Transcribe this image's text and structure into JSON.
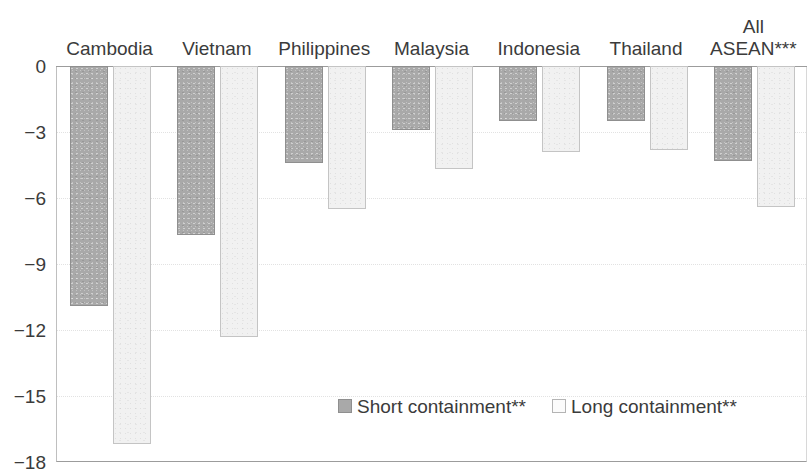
{
  "chart_data": {
    "type": "bar",
    "title": "",
    "subtitle": "",
    "xlabel": "",
    "ylabel": "",
    "ylim": [
      -18,
      0
    ],
    "ytick_step": 3,
    "ytick_labels": [
      "0",
      "−3",
      "−6",
      "−9",
      "−12",
      "−15",
      "−18"
    ],
    "ytick_values": [
      0,
      -3,
      -6,
      -9,
      -12,
      -15,
      -18
    ],
    "grid": true,
    "grid_axis": "y",
    "legend_position": "bottom-right",
    "categories": [
      "Cambodia",
      "Vietnam",
      "Philippines",
      "Malaysia",
      "Indonesia",
      "Thailand",
      "All\nASEAN***"
    ],
    "series": [
      {
        "name": "Short containment**",
        "color": "#a9a9a9",
        "values": [
          -10.9,
          -7.7,
          -4.4,
          -2.9,
          -2.5,
          -2.5,
          -4.3
        ]
      },
      {
        "name": "Long containment**",
        "color": "#f1f1f1",
        "values": [
          -17.2,
          -12.3,
          -6.5,
          -4.7,
          -3.9,
          -3.8,
          -6.4
        ]
      }
    ]
  },
  "legend": {
    "items": [
      {
        "label": "Short containment**",
        "swatch": "short"
      },
      {
        "label": "Long containment**",
        "swatch": "long"
      }
    ]
  },
  "colors": {
    "short_fill": "#a9a9a9",
    "short_border": "#8f8f8f",
    "long_fill": "#f1f1f1",
    "long_border": "#c4c4c4",
    "axis": "#9c9c9c",
    "gridline": "#e2e2e2",
    "text": "#3b3b3b"
  }
}
